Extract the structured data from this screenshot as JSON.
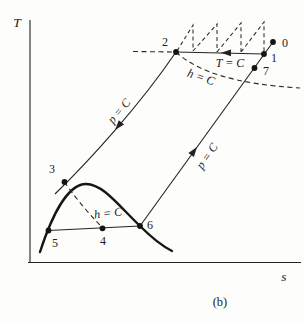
{
  "figure": {
    "caption": "(b)",
    "y_axis_label": "T",
    "x_axis_label": "s"
  },
  "state_points": {
    "p0": "0",
    "p1": "1",
    "p2": "2",
    "p3": "3",
    "p4": "4",
    "p5": "5",
    "p6": "6",
    "p7": "7"
  },
  "process_labels": {
    "t_const": "T = C",
    "h_const_top": "h = C",
    "h_const_bottom": "h = C",
    "p_const_left": "p = C",
    "p_const_right": "p = C"
  },
  "colors": {
    "ink": "#222220",
    "paper": "#fdfdfc"
  }
}
